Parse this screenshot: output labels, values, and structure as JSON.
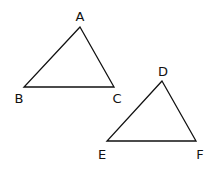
{
  "diagram": {
    "type": "two triangles",
    "triangles": [
      {
        "name": "ABC",
        "vertices": [
          {
            "label": "A",
            "x": 80,
            "y": 27,
            "lx": 80,
            "ly": 21
          },
          {
            "label": "B",
            "x": 24,
            "y": 87,
            "lx": 19,
            "ly": 103
          },
          {
            "label": "C",
            "x": 114,
            "y": 87,
            "lx": 117,
            "ly": 103
          }
        ]
      },
      {
        "name": "DEF",
        "vertices": [
          {
            "label": "D",
            "x": 162,
            "y": 81,
            "lx": 163,
            "ly": 76
          },
          {
            "label": "E",
            "x": 107,
            "y": 141,
            "lx": 102,
            "ly": 159
          },
          {
            "label": "F",
            "x": 196,
            "y": 141,
            "lx": 200,
            "ly": 159
          }
        ]
      }
    ],
    "stroke_color": "#111111"
  }
}
